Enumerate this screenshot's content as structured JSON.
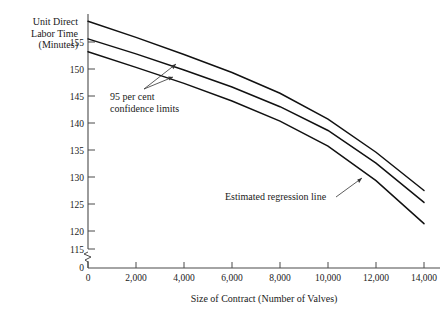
{
  "chart_data": {
    "type": "line",
    "title": "",
    "xlabel": "Size of Contract (Number of Valves)",
    "ylabel": "Unit Direct Labor Time (Minutes)",
    "ylabel_lines": [
      "Unit Direct",
      "Labor Time",
      "(Minutes)"
    ],
    "xlim": [
      0,
      14000
    ],
    "ylim": [
      115,
      160
    ],
    "y_axis_break": true,
    "y_break_note": "axis broken between 0 and 115",
    "grid": false,
    "legend_position": "none",
    "x_ticks": [
      0,
      2000,
      4000,
      6000,
      8000,
      10000,
      12000,
      14000
    ],
    "x_tick_labels": [
      "0",
      "2,000",
      "4,000",
      "6,000",
      "8,000",
      "10,000",
      "12,000",
      "14,000"
    ],
    "y_ticks": [
      115,
      120,
      125,
      130,
      135,
      140,
      145,
      150,
      155
    ],
    "y_tick_labels": [
      "115",
      "120",
      "125",
      "130",
      "135",
      "140",
      "145",
      "150",
      "155"
    ],
    "y_zero_label": "0",
    "series": [
      {
        "name": "Upper 95 per cent confidence limit",
        "x": [
          0,
          2000,
          4000,
          6000,
          8000,
          10000,
          12000,
          14000
        ],
        "values": [
          159.0,
          155.9,
          152.6,
          149.1,
          145.1,
          140.1,
          133.7,
          126.3
        ]
      },
      {
        "name": "Estimated regression line",
        "x": [
          0,
          2000,
          4000,
          6000,
          8000,
          10000,
          12000,
          14000
        ],
        "values": [
          155.6,
          152.7,
          149.6,
          146.3,
          142.5,
          137.9,
          131.6,
          124.0
        ]
      },
      {
        "name": "Lower 95 per cent confidence limit",
        "x": [
          0,
          2000,
          4000,
          6000,
          8000,
          10000,
          12000,
          14000
        ],
        "values": [
          153.1,
          150.1,
          147.0,
          143.6,
          139.7,
          134.9,
          128.2,
          119.9
        ]
      }
    ],
    "annotations": [
      {
        "id": "confidence-limits",
        "lines": [
          "95 per cent",
          "confidence limits"
        ],
        "points_to": [
          "Upper 95 per cent confidence limit",
          "Estimated regression line"
        ]
      },
      {
        "id": "regression-line",
        "lines": [
          "Estimated regression line"
        ],
        "points_to": [
          "Estimated regression line"
        ]
      }
    ],
    "colors": {
      "background": "#ffffff",
      "line": "#111111",
      "axis": "#4a4a4a",
      "text": "#1a1a1a"
    }
  }
}
